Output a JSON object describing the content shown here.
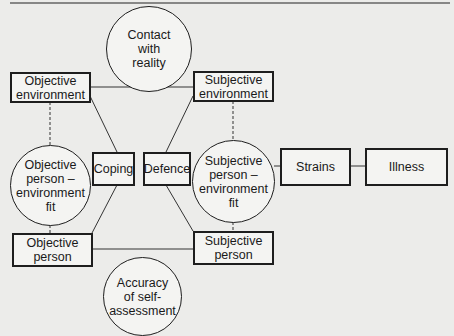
{
  "diagram": {
    "nodes": {
      "contact": {
        "lines": [
          "Contact",
          "with",
          "reality"
        ],
        "shape": "circle"
      },
      "obj_env": {
        "lines": [
          "Objective",
          "environment"
        ],
        "shape": "box"
      },
      "subj_env": {
        "lines": [
          "Subjective",
          "environment"
        ],
        "shape": "box"
      },
      "obj_pe_fit": {
        "lines": [
          "Objective",
          "person –",
          "environment",
          "fit"
        ],
        "shape": "circle"
      },
      "coping": {
        "lines": [
          "Coping"
        ],
        "shape": "box"
      },
      "defence": {
        "lines": [
          "Defence"
        ],
        "shape": "box"
      },
      "subj_pe_fit": {
        "lines": [
          "Subjective",
          "person –",
          "environment",
          "fit"
        ],
        "shape": "circle"
      },
      "strains": {
        "lines": [
          "Strains"
        ],
        "shape": "box"
      },
      "illness": {
        "lines": [
          "Illness"
        ],
        "shape": "box"
      },
      "obj_person": {
        "lines": [
          "Objective",
          "person"
        ],
        "shape": "box"
      },
      "subj_person": {
        "lines": [
          "Subjective",
          "person"
        ],
        "shape": "box"
      },
      "accuracy": {
        "lines": [
          "Accuracy",
          "of self-",
          "assessment"
        ],
        "shape": "circle"
      }
    },
    "edges": [
      {
        "from": "obj_env",
        "to": "subj_env",
        "style": "solid"
      },
      {
        "from": "obj_person",
        "to": "subj_person",
        "style": "solid"
      },
      {
        "from": "obj_env",
        "to": "obj_pe_fit",
        "style": "dashed"
      },
      {
        "from": "obj_pe_fit",
        "to": "obj_person",
        "style": "dashed"
      },
      {
        "from": "subj_env",
        "to": "subj_pe_fit",
        "style": "dashed"
      },
      {
        "from": "subj_pe_fit",
        "to": "subj_person",
        "style": "dashed"
      },
      {
        "from": "obj_env",
        "to": "coping",
        "style": "solid"
      },
      {
        "from": "coping",
        "to": "obj_person",
        "style": "solid"
      },
      {
        "from": "subj_env",
        "to": "defence",
        "style": "solid"
      },
      {
        "from": "defence",
        "to": "subj_person",
        "style": "solid"
      },
      {
        "from": "subj_pe_fit",
        "to": "strains",
        "style": "solid"
      },
      {
        "from": "strains",
        "to": "illness",
        "style": "solid"
      }
    ]
  }
}
